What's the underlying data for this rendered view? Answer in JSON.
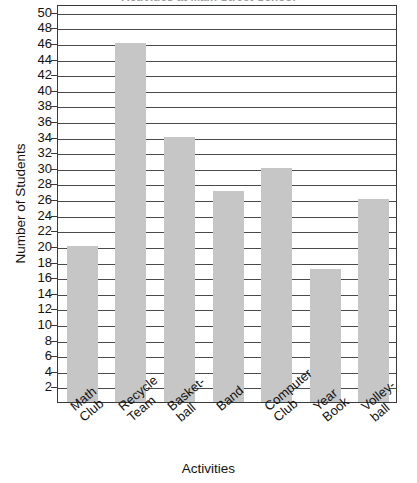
{
  "chart_data": {
    "type": "bar",
    "title": "Activities at Main Street School",
    "xlabel": "Activities",
    "ylabel": "Number of Students",
    "categories": [
      "Math\nClub",
      "Recycle\nTeam",
      "Basket-\nball",
      "Band",
      "Computer\nClub",
      "Year\nBook",
      "Volley-\nball"
    ],
    "values": [
      20,
      46,
      34,
      27,
      30,
      17,
      26
    ],
    "ylim": [
      0,
      51
    ],
    "ytick_labels": [
      "50",
      "48",
      "46",
      "44",
      "42",
      "40",
      "38",
      "36",
      "34",
      "32",
      "30",
      "28",
      "26",
      "24",
      "22",
      "20",
      "18",
      "16",
      "14",
      "12",
      "10",
      "8",
      "6",
      "4",
      "2"
    ],
    "ytick_values": [
      50,
      48,
      46,
      44,
      42,
      40,
      38,
      36,
      34,
      32,
      30,
      28,
      26,
      24,
      22,
      20,
      18,
      16,
      14,
      12,
      10,
      8,
      6,
      4,
      2
    ],
    "ytick_step": 2,
    "grid": true,
    "legend": false,
    "bar_color": "#c6c6c6",
    "axis_color": "#3a3a3a",
    "background": "#ffffff"
  }
}
